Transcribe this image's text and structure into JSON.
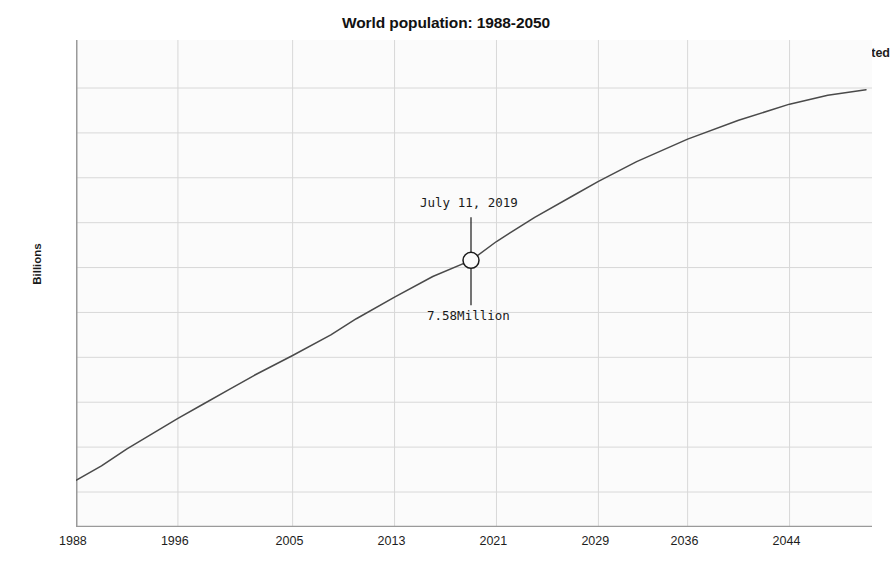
{
  "chart_data": {
    "type": "line",
    "title": "World population: 1988-2050",
    "xlabel": "",
    "ylabel": "Billions",
    "xlim": [
      1988,
      2050
    ],
    "ylim": [
      5.0,
      9.5
    ],
    "grid": true,
    "legend_position": "top-right",
    "xticks": [
      "1988",
      "1996",
      "2005",
      "2013",
      "2021",
      "2029",
      "2036",
      "2044"
    ],
    "xtick_values": [
      1988,
      1996,
      2005,
      2013,
      2021,
      2029,
      2036,
      2044
    ],
    "yticks": [
      "5",
      "5.5",
      "6",
      "6.5",
      "7",
      "7.5",
      "8",
      "8.5",
      "9",
      "9.5"
    ],
    "ytick_values": [
      5,
      5.5,
      6,
      6.5,
      7,
      7.5,
      8,
      8.5,
      9,
      9.5
    ],
    "series": [
      {
        "name": "World population",
        "x": [
          1988,
          1990,
          1992,
          1994,
          1996,
          1998,
          2000,
          2002,
          2005,
          2008,
          2010,
          2013,
          2016,
          2019,
          2021,
          2024,
          2027,
          2029,
          2032,
          2036,
          2040,
          2044,
          2047,
          2050
        ],
        "values": [
          5.13,
          5.29,
          5.48,
          5.65,
          5.82,
          5.98,
          6.14,
          6.3,
          6.52,
          6.75,
          6.93,
          7.17,
          7.4,
          7.58,
          7.79,
          8.06,
          8.3,
          8.46,
          8.68,
          8.93,
          9.14,
          9.32,
          9.42,
          9.48
        ]
      }
    ],
    "legend": [
      {
        "label": "Historical estimates",
        "color": "#8e8e8e"
      },
      {
        "label": "Projected",
        "color": "#2a2a2a"
      }
    ],
    "annotation": {
      "date_label": "July 11, 2019",
      "value_label": "7.58Million",
      "x": 2019,
      "y": 7.58,
      "marker": "circle"
    },
    "colors": {
      "line": "#4a4a4a",
      "grid": "#d8d8d8",
      "axis": "#9a9a9a",
      "background": "#fbfbfb",
      "text": "#1a1a1a"
    }
  }
}
